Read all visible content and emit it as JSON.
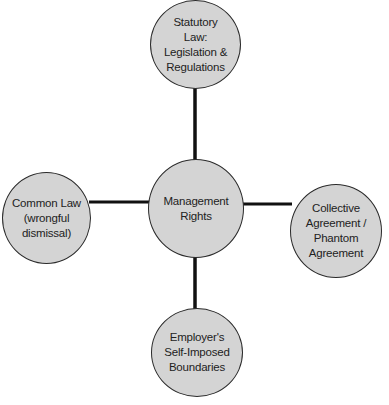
{
  "diagram": {
    "type": "hub-and-spoke",
    "center": {
      "id": "center",
      "label": "Management\nRights"
    },
    "nodes": [
      {
        "id": "top",
        "label": "Statutory\nLaw:\nLegislation &\nRegulations"
      },
      {
        "id": "left",
        "label": "Common Law\n(wrongful\ndismissal)"
      },
      {
        "id": "right",
        "label": "Collective\nAgreement /\nPhantom\nAgreement"
      },
      {
        "id": "bottom",
        "label": "Employer's\nSelf-Imposed\nBoundaries"
      }
    ],
    "edges": [
      {
        "from": "center",
        "to": "top"
      },
      {
        "from": "center",
        "to": "left"
      },
      {
        "from": "center",
        "to": "right"
      },
      {
        "from": "center",
        "to": "bottom"
      }
    ],
    "colors": {
      "node_fill": "#d4d4d4",
      "node_border": "#2a2a2a",
      "connector": "#111111"
    }
  }
}
